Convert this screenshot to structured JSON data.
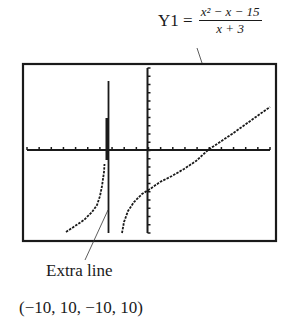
{
  "equation": {
    "lhs": "Y1 =",
    "numerator": "x² − x − 15",
    "denominator": "x + 3"
  },
  "annotations": {
    "extra_line": "Extra line",
    "window": "(−10, 10, −10, 10)"
  },
  "chart_data": {
    "type": "line",
    "xlabel": "",
    "ylabel": "",
    "xlim": [
      -10,
      10
    ],
    "ylim": [
      -10,
      10
    ],
    "xscale": 1,
    "yscale": 1,
    "grid": false,
    "vertical_asymptote": -3,
    "annotations": [
      "Extra line",
      "(−10, 10, −10, 10)"
    ],
    "series": [
      {
        "name": "left branch",
        "x": [
          -6.5,
          -6,
          -5,
          -4,
          -3.5
        ],
        "y": [
          -9.5,
          -8.6,
          -6.8,
          -3.4,
          -1.8
        ]
      },
      {
        "name": "right branch",
        "x": [
          -2.5,
          -2,
          -1,
          0,
          1,
          2,
          3,
          4,
          5,
          6,
          7,
          8,
          9,
          10
        ],
        "y": [
          -9.5,
          -6,
          -4.5,
          -3.6,
          -2.7,
          -1.8,
          -0.9,
          0,
          0.9,
          1.9,
          2.9,
          3.8,
          4.8,
          5.7
        ]
      }
    ]
  }
}
